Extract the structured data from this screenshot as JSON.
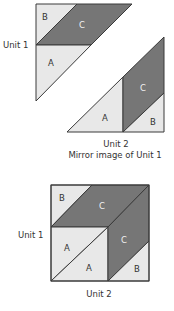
{
  "colors": {
    "light_piece": "#e8e8e8",
    "dark_piece": "#767676",
    "outline": "#3a3a3a",
    "label_dark": "#333333",
    "label_on_dark": "#f2f2f2"
  },
  "top_diagram": {
    "unit1": {
      "label": "Unit 1",
      "pieces": {
        "a": "A",
        "b": "B",
        "c": "C"
      }
    },
    "unit2": {
      "label": "Unit 2",
      "caption": "Mirror image of Unit 1",
      "pieces": {
        "a": "A",
        "b": "B",
        "c": "C"
      }
    }
  },
  "bottom_diagram": {
    "unit1_label": "Unit 1",
    "unit2_label": "Unit 2",
    "pieces": {
      "b_top": "B",
      "c_top": "C",
      "a_left": "A",
      "a_bottom": "A",
      "c_right": "C",
      "b_bottom": "B"
    }
  }
}
